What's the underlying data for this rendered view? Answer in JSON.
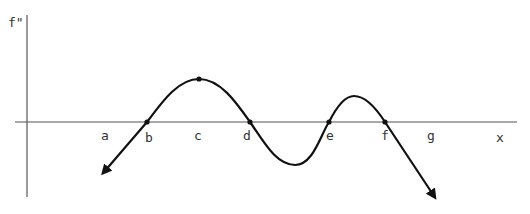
{
  "diagram": {
    "y_axis_label": "f\"",
    "x_axis_label": "x",
    "point_labels": [
      "a",
      "b",
      "c",
      "d",
      "e",
      "f",
      "g"
    ],
    "curve_description": "Graph of f'' crossing the x-axis at b, d, e and f; local maximum at c; local minimum between d and e; local maximum between e and f; arrows at both ends pointing downward",
    "marked_points": [
      {
        "label": "b",
        "type": "zero-crossing"
      },
      {
        "label": "c",
        "type": "local-max"
      },
      {
        "label": "d",
        "type": "zero-crossing"
      },
      {
        "label": "e",
        "type": "zero-crossing"
      },
      {
        "label": "f",
        "type": "zero-crossing"
      }
    ],
    "colors": {
      "curve": "#111111",
      "axis": "#555555",
      "text": "#333333"
    }
  }
}
